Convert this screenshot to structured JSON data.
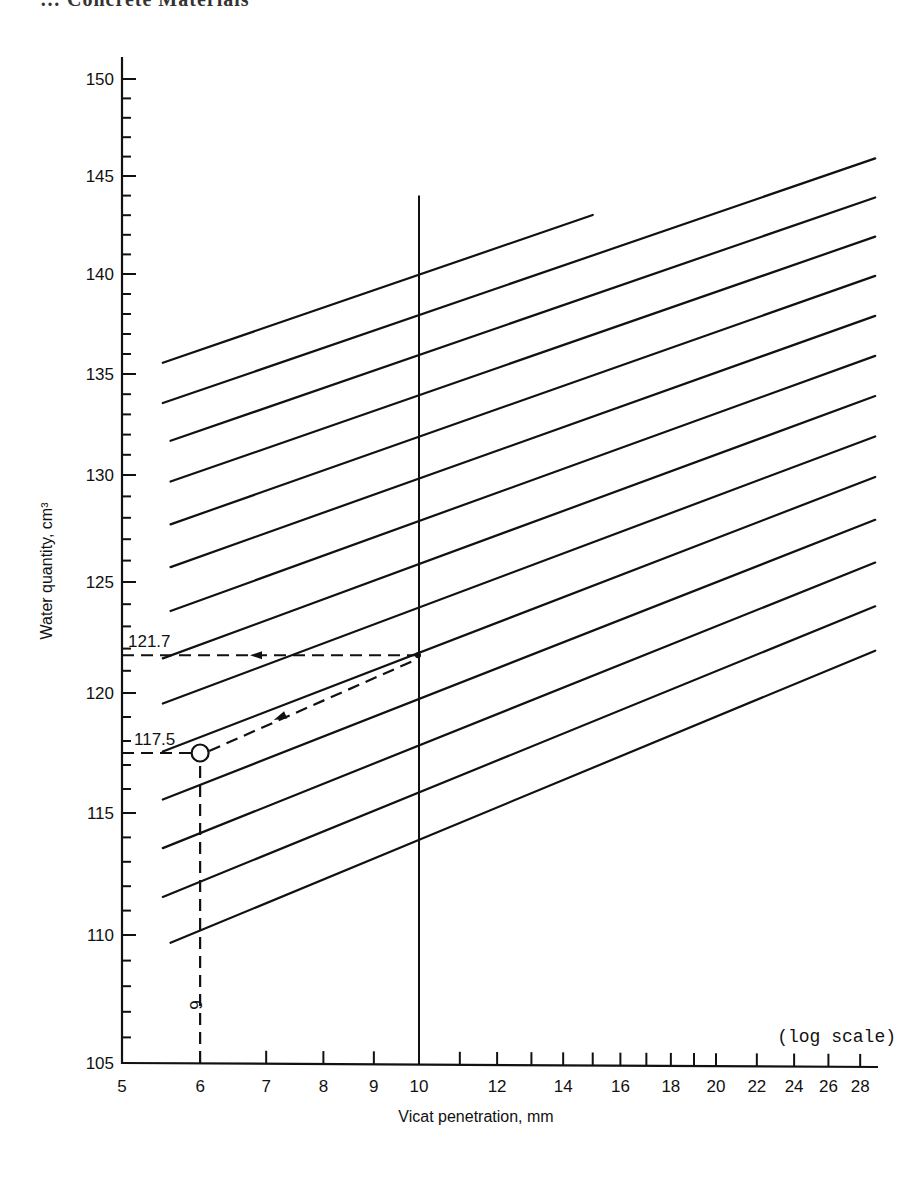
{
  "page": {
    "header_fragment": "…  Concrete Materials"
  },
  "chart_data": {
    "type": "line",
    "title": "",
    "xlabel": "Vicat penetration, mm",
    "ylabel": "Water quantity, cm³",
    "x_scale": "log",
    "x_scale_note": "(log scale)",
    "xlim": [
      5,
      29
    ],
    "ylim": [
      105,
      150
    ],
    "x_ticks": [
      5,
      6,
      7,
      8,
      9,
      10,
      11,
      12,
      13,
      14,
      15,
      16,
      17,
      18,
      19,
      20,
      22,
      24,
      26,
      28
    ],
    "x_tick_labels": [
      "5",
      "6",
      "7",
      "8",
      "9",
      "10",
      "12",
      "14",
      "16",
      "18",
      "20",
      "22",
      "24",
      "26",
      "28"
    ],
    "x_labeled_values": [
      5,
      6,
      7,
      8,
      9,
      10,
      12,
      14,
      16,
      18,
      20,
      22,
      24,
      26,
      28
    ],
    "y_major_ticks": [
      105,
      110,
      115,
      120,
      125,
      130,
      135,
      140,
      145,
      150
    ],
    "y_tick_labels": [
      "105",
      "110",
      "115",
      "120",
      "125",
      "130",
      "135",
      "140",
      "145",
      "150"
    ],
    "y_minor_step": 1,
    "grid": false,
    "legend": "none",
    "slope_per_decade": 17.1,
    "series": [
      {
        "name": "line-140",
        "value_at_10mm": 140,
        "x_start": 5.5,
        "x_end": 15
      },
      {
        "name": "line-138",
        "value_at_10mm": 138,
        "x_start": 5.5,
        "x_end": 29
      },
      {
        "name": "line-136",
        "value_at_10mm": 136,
        "x_start": 5.6,
        "x_end": 29
      },
      {
        "name": "line-134",
        "value_at_10mm": 134,
        "x_start": 5.6,
        "x_end": 29
      },
      {
        "name": "line-132",
        "value_at_10mm": 132,
        "x_start": 5.6,
        "x_end": 29
      },
      {
        "name": "line-130",
        "value_at_10mm": 130,
        "x_start": 5.6,
        "x_end": 29
      },
      {
        "name": "line-128",
        "value_at_10mm": 128,
        "x_start": 5.6,
        "x_end": 29
      },
      {
        "name": "line-126",
        "value_at_10mm": 126,
        "x_start": 5.5,
        "x_end": 29
      },
      {
        "name": "line-124",
        "value_at_10mm": 124,
        "x_start": 5.5,
        "x_end": 29
      },
      {
        "name": "line-122",
        "value_at_10mm": 122,
        "x_start": 5.5,
        "x_end": 29
      },
      {
        "name": "line-120",
        "value_at_10mm": 120,
        "x_start": 5.5,
        "x_end": 29
      },
      {
        "name": "line-118",
        "value_at_10mm": 118,
        "x_start": 5.5,
        "x_end": 29
      },
      {
        "name": "line-116",
        "value_at_10mm": 116,
        "x_start": 5.5,
        "x_end": 29
      },
      {
        "name": "line-114",
        "value_at_10mm": 114,
        "x_start": 5.6,
        "x_end": 29
      }
    ],
    "reference_line": {
      "x": 10,
      "y_top": 144
    },
    "worked_example": {
      "measured_point": {
        "x": 6,
        "y": 117.5
      },
      "result": {
        "x": 10,
        "y": 121.7
      },
      "labels": {
        "measured_y": "117.5",
        "result_y": "121.7",
        "measured_x": "6"
      }
    }
  }
}
